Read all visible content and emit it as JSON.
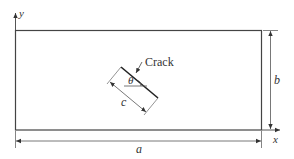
{
  "diagram": {
    "type": "plate-with-inclined-crack",
    "axes": {
      "x_label": "x",
      "y_label": "y"
    },
    "dimensions": {
      "width_label": "a",
      "height_label": "b",
      "crack_length_label": "c"
    },
    "crack": {
      "label": "Crack",
      "angle_label": "θ"
    },
    "colors": {
      "line": "#333333",
      "background": "#ffffff"
    }
  }
}
